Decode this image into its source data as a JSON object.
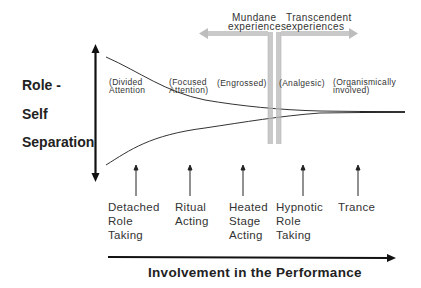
{
  "diagram": {
    "y_axis": {
      "label_lines": [
        "Role -",
        "Self",
        "Separation"
      ],
      "bidirectional": true
    },
    "x_axis": {
      "label": "Involvement in the Performance",
      "direction": "right"
    },
    "experience_divider": {
      "left_label": "Mundane\nexperiences",
      "left_lines": [
        "Mundane",
        "experiences"
      ],
      "right_label": "Transcendent\nexperiences",
      "right_lines": [
        "Transcendent",
        "experiences"
      ]
    },
    "phases": [
      {
        "lines": [
          "(Divided",
          "Attention"
        ]
      },
      {
        "lines": [
          "(Focused",
          "Attention)"
        ]
      },
      {
        "lines": [
          "(Engrossed)"
        ]
      },
      {
        "lines": [
          "(Analgesic)"
        ]
      },
      {
        "lines": [
          "(Organismically",
          "involved)"
        ]
      }
    ],
    "stages": [
      {
        "text": "Detached\nRole\nTaking"
      },
      {
        "text": "Ritual\nActing"
      },
      {
        "text": "Heated\nStage\nActing"
      },
      {
        "text": "Hypnotic\nRole\nTaking"
      },
      {
        "text": "Trance"
      }
    ]
  }
}
